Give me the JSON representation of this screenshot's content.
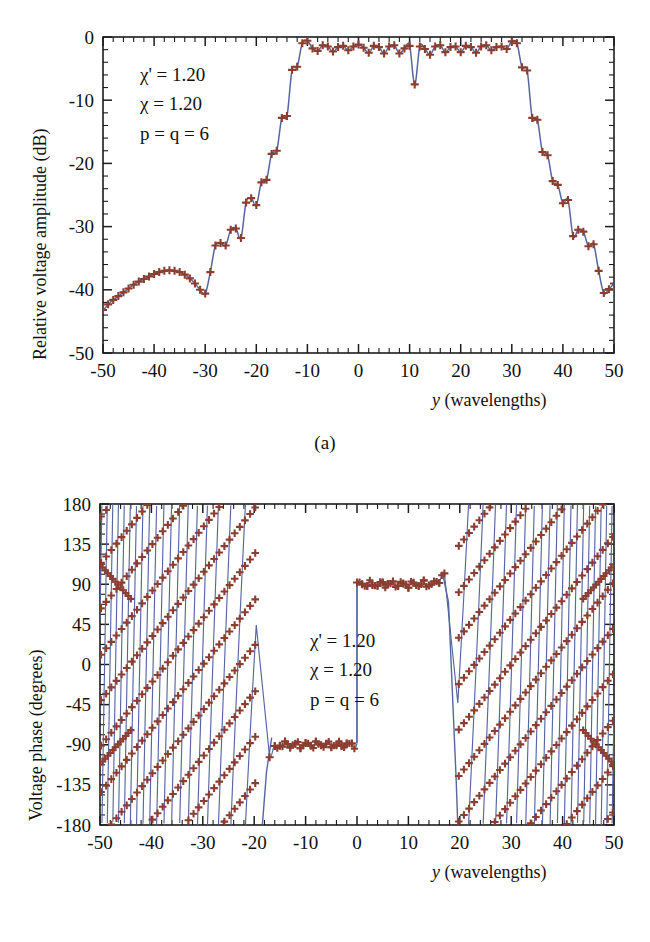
{
  "figure": {
    "panels": [
      {
        "id": "a",
        "caption": "(a)",
        "xlabel_var": "y",
        "xlabel_unit": "(wavelengths)",
        "ylabel": "Relative voltage amplitude (dB)",
        "annotations": [
          {
            "symbol": "χ'",
            "op": "=",
            "value": "1.20"
          },
          {
            "symbol": "χ",
            "op": "=",
            "value": "1.20"
          },
          {
            "symbol": "p = q =",
            "op": "",
            "value": "6"
          }
        ],
        "annotation_lines": [
          "χ' = 1.20",
          "χ = 1.20",
          "p = q = 6"
        ]
      },
      {
        "id": "b",
        "caption": "(b)",
        "xlabel_var": "y",
        "xlabel_unit": "(wavelengths)",
        "ylabel": "Voltage phase (degrees)",
        "annotation_lines": [
          "χ' = 1.20",
          "χ = 1.20",
          "p = q = 6"
        ]
      }
    ],
    "colors": {
      "line": "#5566a0",
      "marker": "#8b3e30",
      "axis": "#1c1c1c",
      "background": "#ffffff"
    }
  },
  "chart_data": [
    {
      "type": "line",
      "panel": "a",
      "title": "",
      "xlabel": "y (wavelengths)",
      "ylabel": "Relative voltage amplitude (dB)",
      "xlim": [
        -50,
        50
      ],
      "ylim": [
        -50,
        0
      ],
      "xticks": [
        -50,
        -40,
        -30,
        -20,
        -10,
        0,
        10,
        20,
        30,
        40,
        50
      ],
      "xtick_labels": [
        "-50",
        "-40",
        "-30",
        "-20",
        "-10",
        "0",
        "10",
        "20",
        "30",
        "40",
        "50"
      ],
      "yticks": [
        0,
        -10,
        -20,
        -30,
        -40,
        -50
      ],
      "ytick_labels": [
        "0",
        "-10",
        "-20",
        "-30",
        "-40",
        "-50"
      ],
      "x_minor_interval": 2,
      "y_minor_interval": 2,
      "grid": false,
      "legend": null,
      "annotations": [
        "χ' = 1.20",
        "χ = 1.20",
        "p = q = 6"
      ],
      "series": [
        {
          "name": "Relative voltage amplitude",
          "marker": "plus",
          "x": [
            -50,
            -49,
            -48,
            -47,
            -46,
            -45,
            -44,
            -43,
            -42,
            -41,
            -40,
            -39,
            -38,
            -37,
            -36,
            -35,
            -34,
            -33,
            -32,
            -31,
            -30,
            -29,
            -28,
            -27,
            -26,
            -25,
            -24,
            -23,
            -22,
            -21,
            -20,
            -19,
            -18,
            -17,
            -16,
            -15,
            -14,
            -13,
            -12,
            -11,
            -10,
            -9,
            -8,
            -7,
            -6,
            -5,
            -4,
            -3,
            -2,
            -1,
            0,
            1,
            2,
            3,
            4,
            5,
            6,
            7,
            8,
            9,
            10,
            11,
            12,
            13,
            14,
            15,
            16,
            17,
            18,
            19,
            20,
            21,
            22,
            23,
            24,
            25,
            26,
            27,
            28,
            29,
            30,
            31,
            32,
            33,
            34,
            35,
            36,
            37,
            38,
            39,
            40,
            41,
            42,
            43,
            44,
            45,
            46,
            47,
            48,
            49,
            50
          ],
          "values": [
            -43.2,
            -42.3,
            -41.6,
            -41.0,
            -40.4,
            -39.8,
            -39.2,
            -38.7,
            -38.3,
            -37.9,
            -37.5,
            -37.2,
            -37.0,
            -36.9,
            -37.0,
            -37.2,
            -37.6,
            -38.2,
            -39.0,
            -40.0,
            -40.6,
            -37.2,
            -33.0,
            -32.6,
            -33.0,
            -30.5,
            -30.3,
            -31.8,
            -26.2,
            -25.5,
            -26.6,
            -23.0,
            -22.6,
            -18.5,
            -18.0,
            -12.8,
            -12.5,
            -5.2,
            -4.7,
            -1.0,
            -0.6,
            -1.8,
            -2.2,
            -1.3,
            -1.5,
            -2.3,
            -1.6,
            -1.4,
            -2.1,
            -1.5,
            -1.2,
            -1.7,
            -2.5,
            -1.4,
            -1.6,
            -2.6,
            -1.5,
            -1.3,
            -2.6,
            -1.8,
            -1.4,
            -7.5,
            -1.5,
            -1.9,
            -2.8,
            -1.5,
            -1.3,
            -2.4,
            -1.6,
            -1.5,
            -2.4,
            -1.4,
            -1.6,
            -2.5,
            -1.5,
            -1.3,
            -2.1,
            -1.6,
            -1.5,
            -1.9,
            -0.7,
            -1.0,
            -4.8,
            -5.3,
            -12.8,
            -13.1,
            -18.2,
            -18.7,
            -22.8,
            -23.4,
            -26.3,
            -25.8,
            -31.5,
            -30.5,
            -30.8,
            -33.1,
            -32.8,
            -37.0,
            -40.5,
            -39.9,
            -39.0,
            -38.3,
            -37.7,
            -37.2,
            -37.0,
            -36.9,
            -37.0,
            -37.2,
            -37.6,
            -38.0,
            -38.5,
            -39.1,
            -39.8,
            -40.5,
            -41.2,
            -42.0,
            -42.8,
            -43.4
          ]
        }
      ],
      "notes": "Flat-top beam pattern: plateau near -1 to -3 dB from y=-15 to y=+16, deep null spike to about -7.5 dB at y=0, steep skirts, sidelobe hump near -37 dB around y=+/-39, edges near -43 dB at y=+/-50."
    },
    {
      "type": "line",
      "panel": "b",
      "title": "",
      "xlabel": "y (wavelengths)",
      "ylabel": "Voltage phase (degrees)",
      "xlim": [
        -50,
        50
      ],
      "ylim": [
        -180,
        180
      ],
      "xticks": [
        -50,
        -40,
        -30,
        -20,
        -10,
        0,
        10,
        20,
        30,
        40,
        50
      ],
      "xtick_labels": [
        "-50",
        "-40",
        "-30",
        "-20",
        "-10",
        "0",
        "10",
        "20",
        "30",
        "40",
        "50"
      ],
      "yticks": [
        180,
        135,
        90,
        45,
        0,
        -45,
        -90,
        -135,
        -180
      ],
      "ytick_labels": [
        "180",
        "135",
        "90",
        "45",
        "0",
        "-45",
        "-90",
        "-135",
        "-180"
      ],
      "x_minor_interval": 2,
      "y_minor_interval": 11.25,
      "grid": false,
      "legend": null,
      "annotations": [
        "χ' = 1.20",
        "χ = 1.20",
        "p = q = 6"
      ],
      "series": [
        {
          "name": "Voltage phase",
          "marker": "plus",
          "description": "Wrapped phase in [-180,180]. Inside |y|<17 the phase is flat near -90 deg for y<0 and near +90 deg for y>0, with a step discontinuity at y=0. Outside |y|>20 the unwrapped phase varies rapidly producing dense sawtooth wrapping; the sampled markers alias into slow diagonal bands.",
          "plateau_left_deg": -90,
          "plateau_right_deg": 90,
          "plateau_left_range": [
            -17,
            0
          ],
          "plateau_right_range": [
            0,
            17
          ],
          "wrap_region_left": [
            -50,
            -19.5
          ],
          "wrap_region_right": [
            19.5,
            50
          ],
          "marker_band_left_start_deg": 112,
          "marker_band_left_end_deg": -180,
          "marker_band_right_start_deg": -180,
          "marker_band_right_end_deg": 112
        }
      ]
    }
  ]
}
